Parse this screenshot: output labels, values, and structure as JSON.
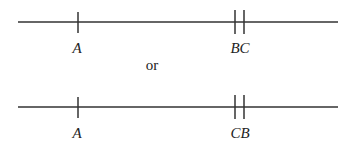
{
  "diagram": {
    "lines": [
      {
        "id": "line-1",
        "points": [
          {
            "label": "A",
            "x": 78,
            "ticks": 1
          },
          {
            "label": "BC",
            "x": 239,
            "ticks": 2
          }
        ]
      },
      {
        "id": "line-2",
        "points": [
          {
            "label": "A",
            "x": 78,
            "ticks": 1
          },
          {
            "label": "CB",
            "x": 239,
            "ticks": 2
          }
        ]
      }
    ],
    "connector": "or",
    "colors": {
      "stroke": "#333333",
      "text": "#222222"
    }
  }
}
